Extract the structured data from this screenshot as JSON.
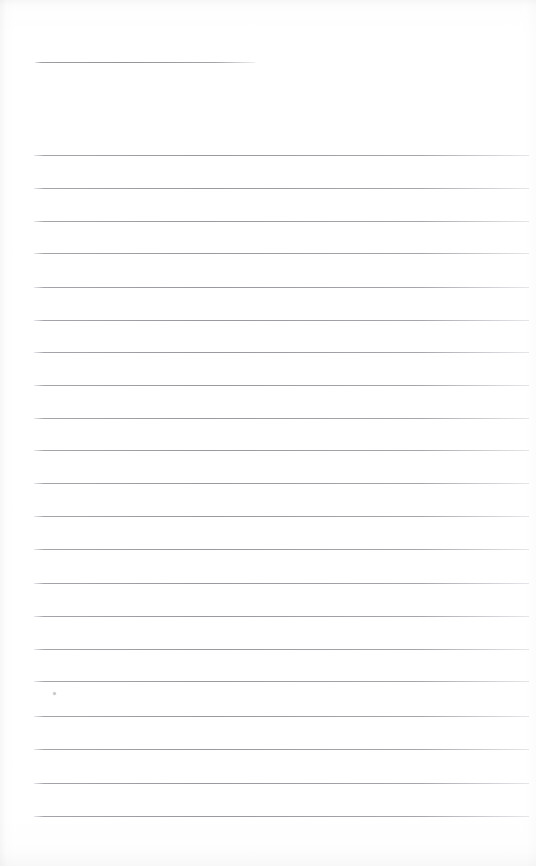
{
  "document": {
    "kind": "scanned-lined-page",
    "page_width": 536,
    "page_height": 866,
    "background_color": "#ffffff",
    "rule_color": "#989aa0",
    "ink_color": "#3a3a3a",
    "title_text": "",
    "header_rule": {
      "x": 35,
      "y": 62,
      "width": 220,
      "thickness": 1
    },
    "ruled_lines": [
      {
        "y": 155,
        "x": 34,
        "width": 495,
        "text": ""
      },
      {
        "y": 188,
        "x": 34,
        "width": 495,
        "text": ""
      },
      {
        "y": 221,
        "x": 34,
        "width": 495,
        "text": ""
      },
      {
        "y": 253,
        "x": 34,
        "width": 495,
        "text": ""
      },
      {
        "y": 287,
        "x": 34,
        "width": 495,
        "text": ""
      },
      {
        "y": 320,
        "x": 34,
        "width": 495,
        "text": ""
      },
      {
        "y": 352,
        "x": 34,
        "width": 495,
        "text": ""
      },
      {
        "y": 385,
        "x": 34,
        "width": 495,
        "text": ""
      },
      {
        "y": 418,
        "x": 34,
        "width": 495,
        "text": ""
      },
      {
        "y": 450,
        "x": 34,
        "width": 495,
        "text": ""
      },
      {
        "y": 483,
        "x": 34,
        "width": 495,
        "text": ""
      },
      {
        "y": 516,
        "x": 34,
        "width": 495,
        "text": ""
      },
      {
        "y": 549,
        "x": 34,
        "width": 495,
        "text": ""
      },
      {
        "y": 583,
        "x": 34,
        "width": 495,
        "text": ""
      },
      {
        "y": 616,
        "x": 34,
        "width": 495,
        "text": ""
      },
      {
        "y": 649,
        "x": 34,
        "width": 495,
        "text": ""
      },
      {
        "y": 681,
        "x": 34,
        "width": 495,
        "text": ""
      },
      {
        "y": 716,
        "x": 34,
        "width": 495,
        "text": ""
      },
      {
        "y": 749,
        "x": 34,
        "width": 495,
        "text": ""
      },
      {
        "y": 783,
        "x": 34,
        "width": 495,
        "text": ""
      },
      {
        "y": 816,
        "x": 34,
        "width": 495,
        "text": ""
      }
    ],
    "marks": [
      {
        "name": "ink-speck",
        "x": 53,
        "y": 692
      }
    ],
    "line_count_label": "21",
    "line_spacing_px": "33"
  }
}
